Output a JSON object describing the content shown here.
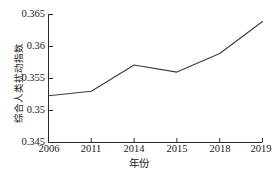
{
  "chart_data": {
    "type": "line",
    "title": "",
    "xlabel": "年份",
    "ylabel": "综合人类扰动指数",
    "categories": [
      "2006",
      "2011",
      "2014",
      "2015",
      "2018",
      "2019"
    ],
    "values": [
      0.3523,
      0.353,
      0.3571,
      0.356,
      0.3589,
      0.3639
    ],
    "series": [
      {
        "name": "综合人类扰动指数",
        "values": [
          0.3523,
          0.353,
          0.3571,
          0.356,
          0.3589,
          0.3639
        ]
      }
    ],
    "ylim": [
      0.345,
      0.365
    ],
    "yticks": [
      "0.345",
      "0.35",
      "0.355",
      "0.36",
      "0.365"
    ],
    "ytick_values": [
      0.345,
      0.35,
      0.355,
      0.36,
      0.365
    ],
    "xticks": [
      "2006",
      "2011",
      "2014",
      "2015",
      "2018",
      "2019"
    ],
    "grid": false,
    "legend": false,
    "legend_position": "none",
    "line_color": "#3c3c3c",
    "axis_color": "#2b2b2b",
    "background_color": "#ffffff"
  },
  "axes": {
    "y": {
      "ticks": [
        {
          "label": "0.365",
          "value": 0.365
        },
        {
          "label": "0.36",
          "value": 0.36
        },
        {
          "label": "0.355",
          "value": 0.355
        },
        {
          "label": "0.35",
          "value": 0.35
        },
        {
          "label": "0.345",
          "value": 0.345
        }
      ]
    },
    "x": {
      "ticks": [
        {
          "label": "2006"
        },
        {
          "label": "2011"
        },
        {
          "label": "2014"
        },
        {
          "label": "2015"
        },
        {
          "label": "2018"
        },
        {
          "label": "2019"
        }
      ]
    }
  }
}
